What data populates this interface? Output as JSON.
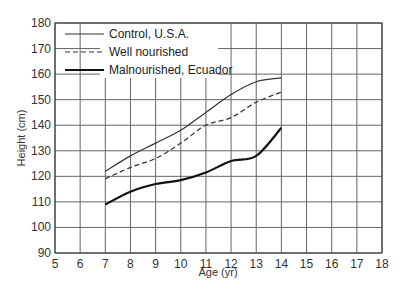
{
  "chart_data": {
    "type": "line",
    "title": "",
    "xlabel": "Age (yr)",
    "ylabel": "Height (cm)",
    "xlim": [
      5,
      18
    ],
    "ylim": [
      90,
      180
    ],
    "xticks": [
      5,
      6,
      7,
      8,
      9,
      10,
      11,
      12,
      13,
      14,
      15,
      16,
      17,
      18
    ],
    "yticks": [
      90,
      100,
      110,
      120,
      130,
      140,
      150,
      160,
      170,
      180
    ],
    "grid": true,
    "legend_position": "upper-left",
    "x": [
      7,
      8,
      9,
      10,
      11,
      12,
      13,
      14
    ],
    "series": [
      {
        "name": "Control, U.S.A.",
        "style": "thin-solid",
        "values": [
          122,
          128,
          133,
          138,
          145,
          152,
          157,
          158.5
        ]
      },
      {
        "name": "Well nourished",
        "style": "dashed",
        "values": [
          119,
          123.5,
          127,
          133,
          140,
          143,
          149,
          153
        ]
      },
      {
        "name": "Malnourished, Ecuador",
        "style": "thick-solid",
        "values": [
          109,
          114,
          117,
          118.5,
          121.5,
          126,
          128,
          139
        ]
      }
    ]
  }
}
